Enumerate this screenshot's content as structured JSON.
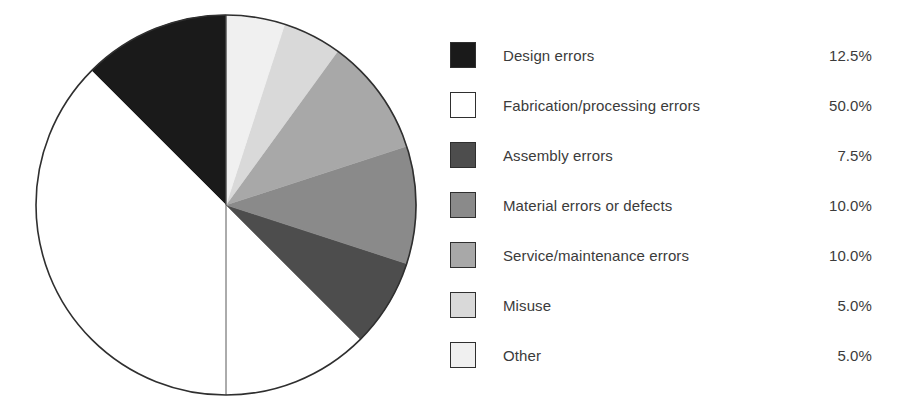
{
  "chart_data": {
    "type": "pie",
    "title": "",
    "subtitle": "",
    "xlabel": "",
    "ylabel": "",
    "legend_position": "right",
    "grid": false,
    "start_angle_deg": 90,
    "direction": "counterclockwise",
    "categories": [
      "Design errors",
      "Fabrication/processing errors",
      "Assembly errors",
      "Material errors or defects",
      "Service/maintenance errors",
      "Misuse",
      "Other"
    ],
    "values": [
      12.5,
      50.0,
      7.5,
      10.0,
      10.0,
      5.0,
      5.0
    ],
    "value_labels": [
      "12.5%",
      "50.0%",
      "7.5%",
      "10.0%",
      "10.0%",
      "5.0%",
      "5.0%"
    ],
    "colors": [
      "#1a1a1a",
      "#ffffff",
      "#4d4d4d",
      "#8a8a8a",
      "#a8a8a8",
      "#d9d9d9",
      "#f0f0f0"
    ],
    "slice_border_color": "#2f2f2f",
    "units": "percent"
  },
  "legend": {
    "rows": [
      {
        "label": "Design errors",
        "value": "12.5%",
        "color": "#1a1a1a"
      },
      {
        "label": "Fabrication/processing errors",
        "value": "50.0%",
        "color": "#ffffff"
      },
      {
        "label": "Assembly errors",
        "value": "7.5%",
        "color": "#4d4d4d"
      },
      {
        "label": "Material errors or defects",
        "value": "10.0%",
        "color": "#8a8a8a"
      },
      {
        "label": "Service/maintenance errors",
        "value": "10.0%",
        "color": "#a8a8a8"
      },
      {
        "label": "Misuse",
        "value": "5.0%",
        "color": "#d9d9d9"
      },
      {
        "label": "Other",
        "value": "5.0%",
        "color": "#f0f0f0"
      }
    ]
  },
  "pie": {
    "center_x": 226,
    "center_y": 205,
    "radius": 190,
    "outline_color": "#2f2f2f"
  }
}
